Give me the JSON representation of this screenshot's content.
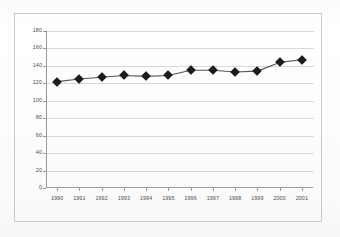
{
  "chart_data": {
    "type": "line",
    "title": "",
    "subtitle": "",
    "xlabel": "",
    "ylabel": "",
    "categories": [
      "1990",
      "1991",
      "1992",
      "1993",
      "1994",
      "1995",
      "1996",
      "1997",
      "1998",
      "1999",
      "2000",
      "2001"
    ],
    "values": [
      122,
      125,
      127,
      129,
      128,
      129,
      135,
      135,
      133,
      134,
      144,
      147
    ],
    "series": [
      {
        "name": "",
        "values": [
          122,
          125,
          127,
          129,
          128,
          129,
          135,
          135,
          133,
          134,
          144,
          147
        ]
      }
    ],
    "ylim": [
      0,
      180
    ],
    "ytick_labels": [
      "180",
      "160",
      "140",
      "120",
      "100",
      "80",
      "60",
      "40",
      "20",
      "0"
    ],
    "ytick_values": [
      180,
      160,
      140,
      120,
      100,
      80,
      60,
      40,
      20,
      0
    ],
    "ystep": 20,
    "grid": "horizontal",
    "legend": "none",
    "marker": "diamond",
    "line_color": "#555555",
    "marker_color": "#1c1c1c",
    "gridline_color": "#d8d8d8",
    "axis_color": "#9a9a9a",
    "plot_background": "#ffffff",
    "annotations": []
  }
}
